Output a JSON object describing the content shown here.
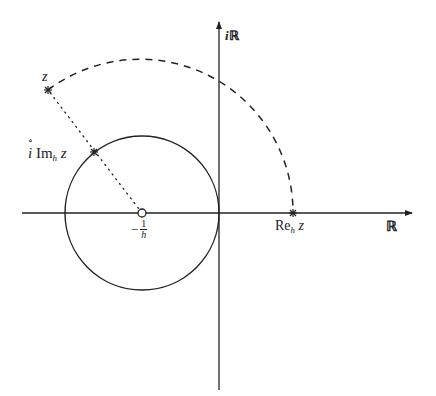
{
  "diagram": {
    "type": "complex-plane-construction",
    "axes": {
      "real_label_main": "ℝ",
      "imag_label_prefix": "i",
      "imag_label_main": "ℝ"
    },
    "points": {
      "z": {
        "label": "z"
      },
      "center": {
        "label_sign": "−",
        "label_num": "1",
        "label_den": "h"
      },
      "re_point": {
        "label_main": "Re",
        "label_sub": "h",
        "label_var": "z"
      },
      "im_point": {
        "label_circ": "∘",
        "label_i": "i",
        "label_main": "Im",
        "label_sub": "h",
        "label_var": "z"
      }
    },
    "elements": [
      "solid circle centered at −1/h passing through origin",
      "dashed arc centered at −1/h from z to Re_h z on real axis",
      "dotted segment from −1/h to z intersecting circle at Im_h z"
    ],
    "colors": {
      "stroke": "#222222",
      "background": "#ffffff"
    }
  }
}
